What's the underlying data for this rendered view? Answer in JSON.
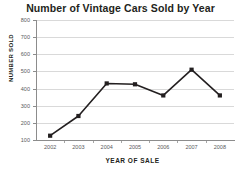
{
  "chart_data": {
    "type": "line",
    "title": "Number of Vintage Cars Sold by Year",
    "xlabel": "YEAR OF SALE",
    "ylabel": "NUMBER SOLD",
    "categories": [
      "2002",
      "2003",
      "2004",
      "2005",
      "2006",
      "2007",
      "2008"
    ],
    "values": [
      125,
      240,
      430,
      425,
      360,
      510,
      360
    ],
    "series": [
      {
        "name": "Number sold",
        "values": [
          125,
          240,
          430,
          425,
          360,
          510,
          360
        ]
      }
    ],
    "ylim": [
      100,
      800
    ],
    "yticks": [
      100,
      200,
      300,
      400,
      500,
      600,
      700,
      800
    ],
    "ytick_labels": [
      "100",
      "200",
      "300",
      "400",
      "500",
      "600",
      "700",
      "800"
    ],
    "grid": "horizontal",
    "legend": "none",
    "marker": "square",
    "line_color": "#231f20",
    "marker_color": "#231f20",
    "gridline_color": "#d9d9d9",
    "axis_color": "#8c8c8c",
    "background_color": "#ffffff",
    "text_color": "#231f20"
  }
}
